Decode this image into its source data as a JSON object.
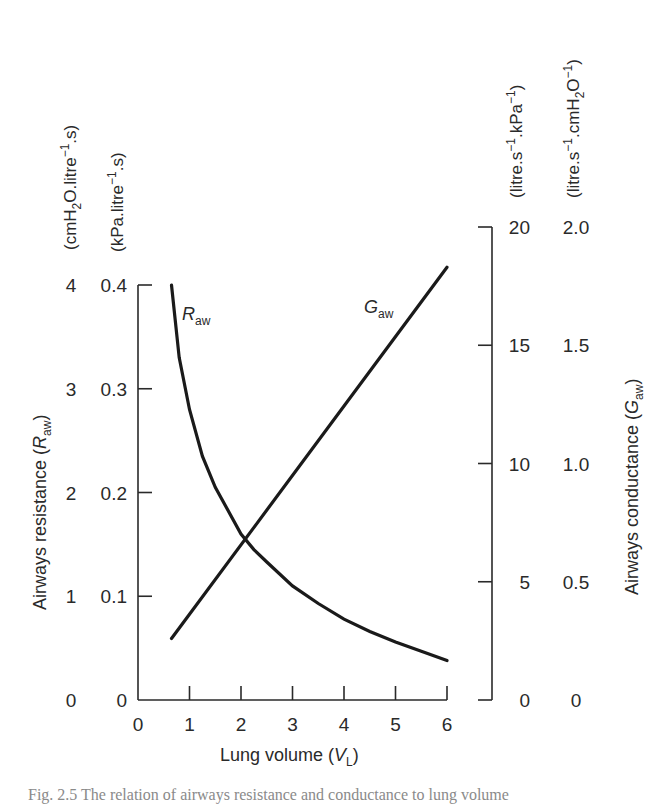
{
  "chart_data": {
    "type": "line",
    "title": "",
    "xlabel": "Lung volume (V_L)",
    "x_ticks": [
      0,
      1,
      2,
      3,
      4,
      5,
      6
    ],
    "xlim": [
      0,
      6
    ],
    "y_left": {
      "label": "Airways resistance (R_aw)",
      "units_outer": "(cmH2O.litre-1.s)",
      "units_inner": "(kPa.litre-1.s)",
      "ticks_outer": [
        "0",
        "1",
        "2",
        "3",
        "4"
      ],
      "ticks_inner": [
        "0",
        "0.1",
        "0.2",
        "0.3",
        "0.4"
      ],
      "ylim": [
        0,
        4
      ]
    },
    "y_right": {
      "label": "Airways conductance (G_aw)",
      "units_inner": "(litre.s-1.kPa-1)",
      "units_outer": "(litre.s-1.cmH2O-1)",
      "ticks_inner": [
        "0",
        "5",
        "10",
        "15",
        "20"
      ],
      "ticks_outer": [
        "0",
        "0.5",
        "1.0",
        "1.5",
        "2.0"
      ],
      "ylim": [
        0,
        20
      ]
    },
    "series": [
      {
        "name": "R_aw",
        "axis": "left (cmH2O.litre-1.s)",
        "x": [
          0.65,
          0.8,
          1.0,
          1.25,
          1.5,
          2.0,
          2.25,
          2.5,
          3.0,
          3.5,
          4.0,
          4.5,
          5.0,
          5.5,
          6.0
        ],
        "values": [
          4.0,
          3.3,
          2.8,
          2.35,
          2.05,
          1.6,
          1.45,
          1.33,
          1.1,
          0.93,
          0.78,
          0.66,
          0.56,
          0.47,
          0.38
        ]
      },
      {
        "name": "G_aw",
        "axis": "right (litre.s-1.kPa-1)",
        "x": [
          0.65,
          6.0
        ],
        "values": [
          2.6,
          18.3
        ]
      }
    ],
    "annotations": [
      {
        "text": "R_aw",
        "near_x": 0.9,
        "near_y_left": 3.75
      },
      {
        "text": "G_aw",
        "near_x": 3.8,
        "near_y_right": 16.5
      }
    ],
    "grid": false,
    "legend": "inline labels"
  },
  "labels": {
    "x_title": "Lung volume (",
    "x_title_var": "V",
    "x_title_sub": "L",
    "x_title_close": ")",
    "left_title": "Airways resistance (",
    "left_title_var": "R",
    "left_title_sub": "aw",
    "left_title_close": ")",
    "right_title": "Airways conductance (",
    "right_title_var": "G",
    "right_title_sub": "aw",
    "right_title_close": ")",
    "left_unit_outer_a": "(cmH",
    "left_unit_outer_sub": "2",
    "left_unit_outer_b": "O.litre",
    "left_unit_outer_sup": "−1",
    "left_unit_outer_c": ".s)",
    "left_unit_inner_a": "(kPa.litre",
    "left_unit_inner_sup": "−1",
    "left_unit_inner_b": ".s)",
    "right_unit_inner_a": "(litre.s",
    "right_unit_inner_sup1": "−1",
    "right_unit_inner_b": ".kPa",
    "right_unit_inner_sup2": "−1",
    "right_unit_inner_c": ")",
    "right_unit_outer_a": "(litre.s",
    "right_unit_outer_sup1": "−1",
    "right_unit_outer_b": ".cmH",
    "right_unit_outer_sub": "2",
    "right_unit_outer_c": "O",
    "right_unit_outer_sup2": "−1",
    "right_unit_outer_d": ")",
    "raw_label": "R",
    "raw_label_sub": "aw",
    "gaw_label": "G",
    "gaw_label_sub": "aw"
  },
  "caption_fragment": "Fig. 2.5 The relation of airways resistance and conductance to lung volume"
}
